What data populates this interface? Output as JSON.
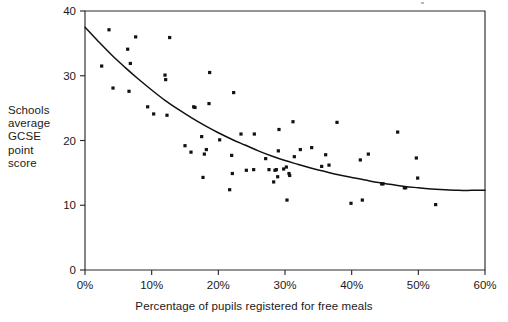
{
  "chart_data": {
    "type": "scatter",
    "title": "",
    "subtitle": "",
    "xlabel": "Percentage of pupils registered for free meals",
    "ylabel": "Schools average GCSE point score",
    "ylabel_lines": [
      "Schools",
      "average",
      "GCSE",
      "point",
      "score"
    ],
    "xlim": [
      0,
      60
    ],
    "ylim": [
      0,
      40
    ],
    "xticks": [
      0,
      10,
      20,
      30,
      40,
      50,
      60
    ],
    "xticklabels": [
      "0%",
      "10%",
      "20%",
      "30%",
      "40%",
      "50%",
      "60%"
    ],
    "yticks": [
      0,
      10,
      20,
      30,
      40
    ],
    "yticklabels": [
      "0",
      "10",
      "20",
      "30",
      "40"
    ],
    "grid": false,
    "legend": false,
    "legend_position": "none",
    "marker": "square",
    "marker_color": "#111111",
    "fit_line_color": "#111111",
    "fit_line_label": "fitted trend curve",
    "points": [
      [
        2.5,
        31.5
      ],
      [
        3.6,
        37.1
      ],
      [
        4.2,
        28.1
      ],
      [
        6.4,
        34.1
      ],
      [
        6.6,
        27.6
      ],
      [
        6.8,
        31.9
      ],
      [
        7.6,
        36.0
      ],
      [
        9.4,
        25.2
      ],
      [
        10.3,
        24.1
      ],
      [
        12.0,
        30.1
      ],
      [
        12.1,
        29.4
      ],
      [
        12.3,
        23.9
      ],
      [
        12.7,
        35.9
      ],
      [
        15.0,
        19.2
      ],
      [
        15.9,
        18.2
      ],
      [
        16.3,
        25.2
      ],
      [
        16.5,
        25.1
      ],
      [
        17.5,
        20.6
      ],
      [
        17.7,
        14.3
      ],
      [
        17.9,
        17.9
      ],
      [
        18.2,
        18.6
      ],
      [
        18.6,
        25.7
      ],
      [
        18.7,
        30.5
      ],
      [
        20.2,
        20.1
      ],
      [
        21.7,
        12.4
      ],
      [
        22.0,
        17.7
      ],
      [
        22.1,
        14.9
      ],
      [
        22.3,
        27.4
      ],
      [
        23.4,
        21.0
      ],
      [
        24.2,
        15.4
      ],
      [
        25.3,
        15.5
      ],
      [
        25.4,
        21.0
      ],
      [
        27.1,
        17.2
      ],
      [
        27.6,
        15.5
      ],
      [
        28.3,
        13.6
      ],
      [
        28.5,
        15.4
      ],
      [
        28.7,
        15.5
      ],
      [
        28.9,
        14.4
      ],
      [
        29.0,
        18.4
      ],
      [
        29.1,
        21.7
      ],
      [
        29.8,
        15.6
      ],
      [
        30.2,
        15.9
      ],
      [
        30.3,
        10.8
      ],
      [
        30.6,
        14.9
      ],
      [
        30.7,
        14.6
      ],
      [
        31.2,
        22.9
      ],
      [
        31.4,
        17.5
      ],
      [
        32.3,
        18.6
      ],
      [
        34.0,
        18.9
      ],
      [
        35.5,
        16.0
      ],
      [
        36.1,
        17.8
      ],
      [
        36.6,
        16.2
      ],
      [
        37.8,
        22.8
      ],
      [
        39.9,
        10.3
      ],
      [
        41.3,
        17.0
      ],
      [
        41.6,
        10.8
      ],
      [
        42.5,
        17.9
      ],
      [
        44.5,
        13.3
      ],
      [
        44.7,
        13.3
      ],
      [
        46.9,
        21.3
      ],
      [
        47.9,
        12.7
      ],
      [
        48.1,
        12.7
      ],
      [
        49.7,
        17.3
      ],
      [
        49.9,
        14.2
      ],
      [
        52.6,
        10.1
      ]
    ],
    "fit_curve": [
      [
        0.0,
        37.5
      ],
      [
        2.0,
        35.3
      ],
      [
        4.0,
        33.2
      ],
      [
        6.0,
        31.3
      ],
      [
        8.0,
        29.5
      ],
      [
        10.0,
        27.8
      ],
      [
        12.0,
        26.2
      ],
      [
        14.0,
        24.8
      ],
      [
        16.0,
        23.5
      ],
      [
        18.0,
        22.3
      ],
      [
        20.0,
        21.2
      ],
      [
        22.0,
        20.2
      ],
      [
        24.0,
        19.3
      ],
      [
        26.0,
        18.4
      ],
      [
        28.0,
        17.6
      ],
      [
        30.0,
        16.9
      ],
      [
        32.0,
        16.3
      ],
      [
        34.0,
        15.7
      ],
      [
        36.0,
        15.2
      ],
      [
        38.0,
        14.7
      ],
      [
        40.0,
        14.3
      ],
      [
        42.0,
        13.9
      ],
      [
        44.0,
        13.5
      ],
      [
        46.0,
        13.2
      ],
      [
        48.0,
        12.9
      ],
      [
        50.0,
        12.7
      ],
      [
        52.0,
        12.5
      ],
      [
        54.0,
        12.4
      ],
      [
        56.0,
        12.3
      ],
      [
        58.0,
        12.3
      ],
      [
        60.0,
        12.3
      ]
    ]
  },
  "geometry": {
    "plot_left": 85,
    "plot_right": 485,
    "plot_top": 11,
    "plot_bottom": 270
  }
}
